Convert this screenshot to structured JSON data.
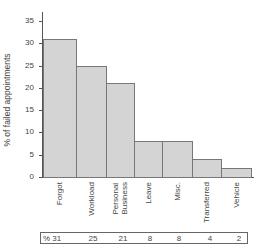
{
  "chart_data": {
    "type": "bar",
    "title": "",
    "xlabel": "",
    "ylabel": "% of failed appointments",
    "ylim": [
      0,
      37
    ],
    "yticks": [
      0,
      5,
      10,
      15,
      20,
      25,
      30,
      35
    ],
    "grid": false,
    "categories": [
      "Forgot",
      "Workload",
      "Personal\nBusiness",
      "Leave",
      "Misc.",
      "Transferred",
      "Vehicle"
    ],
    "values": [
      31,
      25,
      21,
      8,
      8,
      4,
      2
    ],
    "table": {
      "prefix": "%",
      "values": [
        "31",
        "25",
        "21",
        "8",
        "8",
        "4",
        "2"
      ]
    },
    "bar_color": "#d4d4d4",
    "edge_color": "#777777"
  }
}
